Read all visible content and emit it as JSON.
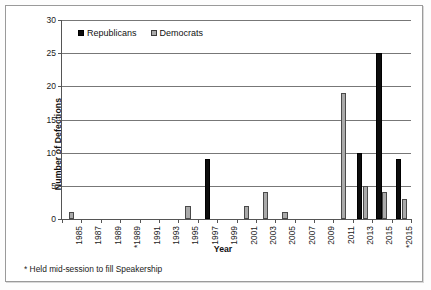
{
  "chart_data": {
    "type": "bar",
    "title": "",
    "xlabel": "Year",
    "ylabel": "Number of Defections",
    "ylim": [
      0,
      30
    ],
    "yticks": [
      0,
      5,
      10,
      15,
      20,
      25,
      30
    ],
    "grid": true,
    "legend_position": "top-left",
    "categories": [
      "1985",
      "1987",
      "1989",
      "*1989",
      "1991",
      "1993",
      "1995",
      "1997",
      "1999",
      "2001",
      "2003",
      "2005",
      "2007",
      "2009",
      "2011",
      "2013",
      "2015",
      "*2015"
    ],
    "series": [
      {
        "name": "Republicans",
        "color": "#0d0d0d",
        "values": [
          0,
          0,
          0,
          0,
          0,
          0,
          0,
          9,
          0,
          0,
          0,
          0,
          0,
          0,
          0,
          10,
          25,
          9
        ]
      },
      {
        "name": "Democrats",
        "color": "#aaaaaa",
        "values": [
          1,
          0,
          0,
          0,
          0,
          0,
          2,
          0,
          0,
          2,
          4,
          1,
          0,
          0,
          19,
          5,
          4,
          3
        ]
      }
    ],
    "annotations": [
      "* Held mid-session to fill Speakership"
    ]
  },
  "legend": {
    "items": [
      {
        "label": "Republicans",
        "swatch": "black-square-icon"
      },
      {
        "label": "Democrats",
        "swatch": "gray-square-icon"
      }
    ]
  },
  "footnote": "* Held mid-session to fill Speakership"
}
